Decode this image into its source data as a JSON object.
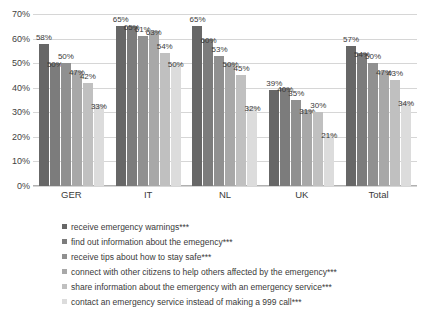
{
  "chart_data": {
    "type": "bar",
    "title": "",
    "xlabel": "",
    "ylabel": "",
    "ylim": [
      0,
      70
    ],
    "grid": true,
    "legend_position": "bottom",
    "categories": [
      "GER",
      "IT",
      "NL",
      "UK",
      "Total"
    ],
    "ytick_labels": [
      "70%",
      "60%",
      "50%",
      "40%",
      "30%",
      "20%",
      "10%",
      "0%"
    ],
    "ytick_values": [
      70,
      60,
      50,
      40,
      30,
      20,
      10,
      0
    ],
    "series": [
      {
        "name": "receive emergency warnings***",
        "color": "#676767",
        "values": [
          58,
          65,
          65,
          39,
          57
        ],
        "labels": [
          "58%",
          "65%",
          "65%",
          "39%",
          "57%"
        ]
      },
      {
        "name": "find out information about the emegency***",
        "color": "#7c7c7c",
        "values": [
          50,
          65,
          60,
          40,
          54
        ],
        "labels": [
          "50%",
          "65%",
          "60%",
          "40%",
          "54%"
        ]
      },
      {
        "name": "receive tips about how to stay safe***",
        "color": "#909090",
        "values": [
          50,
          61,
          53,
          35,
          50
        ],
        "labels": [
          "50%",
          "61%",
          "53%",
          "35%",
          "50%"
        ]
      },
      {
        "name": "connect with other citizens to help others affected by the emergency***",
        "color": "#a8a8a8",
        "values": [
          47,
          63,
          50,
          31,
          47
        ],
        "labels": [
          "47%",
          "63%",
          "50%",
          "31%",
          "47%"
        ]
      },
      {
        "name": "share information about the emergency with an emergency service***",
        "color": "#c0c0c0",
        "values": [
          42,
          54,
          45,
          30,
          43
        ],
        "labels": [
          "42%",
          "54%",
          "45%",
          "30%",
          "43%"
        ]
      },
      {
        "name": "contact an emergency service instead of making a 999 call***",
        "color": "#dcdcdc",
        "values": [
          33,
          50,
          32,
          21,
          34
        ],
        "labels": [
          "33%",
          "50%",
          "32%",
          "21%",
          "34%"
        ]
      }
    ]
  }
}
